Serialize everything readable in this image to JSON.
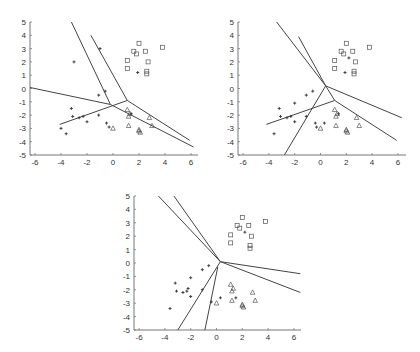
{
  "chart_data": [
    {
      "type": "scatter",
      "title": "",
      "xlabel": "",
      "ylabel": "",
      "xlim": [
        -6.5,
        6.5
      ],
      "ylim": [
        -5,
        5
      ],
      "xticks": [
        -6,
        -4,
        -2,
        0,
        2,
        4,
        6
      ],
      "yticks": [
        5,
        4,
        3,
        2,
        1,
        0,
        -1,
        -2,
        -3,
        -4,
        -5
      ],
      "grid": false,
      "frame": {
        "x0": 30,
        "x1": 198,
        "y0": 22,
        "y1": 155,
        "xpx_per_unit": 13.0,
        "x_zero": 113,
        "ypx_per_unit": 13.3,
        "y_zero": 88.5
      },
      "series": [
        {
          "name": "squares",
          "marker": "square",
          "points": [
            [
              2,
              3.4
            ],
            [
              3.8,
              3.1
            ],
            [
              1.6,
              2.8
            ],
            [
              1.8,
              2.6
            ],
            [
              2.5,
              2.8
            ],
            [
              2.7,
              2.0
            ],
            [
              1.1,
              2.1
            ],
            [
              1.1,
              1.5
            ],
            [
              2.6,
              1.3
            ],
            [
              2.6,
              1.1
            ]
          ]
        },
        {
          "name": "triangles",
          "marker": "triangle",
          "points": [
            [
              1.1,
              -1.6
            ],
            [
              1.3,
              -1.9
            ],
            [
              1.2,
              -2.1
            ],
            [
              2.8,
              -2.2
            ],
            [
              3.0,
              -2.8
            ],
            [
              1.2,
              -2.8
            ],
            [
              0.0,
              -3.0
            ],
            [
              2.0,
              -3.1
            ],
            [
              2.1,
              -3.3
            ],
            [
              2.0,
              -3.2
            ]
          ]
        },
        {
          "name": "plus",
          "marker": "plus",
          "points": [
            [
              -1,
              3
            ],
            [
              -3,
              2
            ],
            [
              -0.6,
              -0.2
            ],
            [
              -1.1,
              -0.5
            ],
            [
              -3.2,
              -1.5
            ],
            [
              -3.1,
              -2.1
            ],
            [
              -2.6,
              -2.2
            ],
            [
              -2.3,
              -2.1
            ],
            [
              -1.1,
              -2.0
            ],
            [
              -2.0,
              -2.5
            ],
            [
              -4.0,
              -3.0
            ],
            [
              -3.6,
              -3.4
            ],
            [
              -0.3,
              -2.9
            ],
            [
              -0.5,
              -2.6
            ],
            [
              1.9,
              1.2
            ],
            [
              1.4,
              -1.9
            ]
          ]
        }
      ],
      "lines": [
        [
          [
            -3.2,
            5
          ],
          [
            -0.2,
            -1.2
          ]
        ],
        [
          [
            -1.7,
            4
          ],
          [
            1.1,
            -0.9
          ]
        ],
        [
          [
            -6.5,
            0.1
          ],
          [
            -0.2,
            -1.2
          ]
        ],
        [
          [
            -0.2,
            -1.2
          ],
          [
            6.2,
            -4.4
          ]
        ],
        [
          [
            1.1,
            -0.9
          ],
          [
            5.9,
            -3.9
          ]
        ],
        [
          [
            -4.1,
            -2.7
          ],
          [
            1.1,
            -0.9
          ]
        ]
      ]
    },
    {
      "type": "scatter",
      "title": "",
      "xlabel": "",
      "ylabel": "",
      "xlim": [
        -6.5,
        6.5
      ],
      "ylim": [
        -5,
        5
      ],
      "xticks": [
        -6,
        -4,
        -2,
        0,
        2,
        4,
        6
      ],
      "yticks": [
        5,
        4,
        3,
        2,
        1,
        0,
        -1,
        -2,
        -3,
        -4,
        -5
      ],
      "grid": false,
      "frame": {
        "x0": 238,
        "x1": 406,
        "y0": 22,
        "y1": 155,
        "xpx_per_unit": 12.9,
        "x_zero": 320.5,
        "ypx_per_unit": 13.3,
        "y_zero": 88.5
      },
      "series": [
        {
          "name": "squares",
          "marker": "square",
          "points": [
            [
              2,
              3.4
            ],
            [
              3.8,
              3.1
            ],
            [
              1.6,
              2.8
            ],
            [
              1.8,
              2.6
            ],
            [
              2.5,
              2.8
            ],
            [
              2.7,
              2.0
            ],
            [
              1.1,
              2.1
            ],
            [
              1.1,
              1.5
            ],
            [
              2.6,
              1.3
            ],
            [
              2.6,
              1.1
            ]
          ]
        },
        {
          "name": "triangles",
          "marker": "triangle",
          "points": [
            [
              1.1,
              -1.6
            ],
            [
              1.3,
              -1.9
            ],
            [
              1.2,
              -2.1
            ],
            [
              2.8,
              -2.2
            ],
            [
              3.0,
              -2.8
            ],
            [
              1.2,
              -2.8
            ],
            [
              0.0,
              -3.0
            ],
            [
              2.0,
              -3.1
            ],
            [
              2.1,
              -3.3
            ],
            [
              2.0,
              -3.2
            ]
          ]
        },
        {
          "name": "plus",
          "marker": "plus",
          "points": [
            [
              2.2,
              2.3
            ],
            [
              1.9,
              1.2
            ],
            [
              -0.6,
              -0.2
            ],
            [
              -1.1,
              -0.5
            ],
            [
              -2,
              -1.1
            ],
            [
              -3.2,
              -1.5
            ],
            [
              -3.1,
              -2.1
            ],
            [
              -2.6,
              -2.2
            ],
            [
              -2.3,
              -2.1
            ],
            [
              -1.1,
              -2.1
            ],
            [
              -2.0,
              -2.5
            ],
            [
              -3.6,
              -3.4
            ],
            [
              -0.3,
              -2.9
            ],
            [
              -0.4,
              -2.6
            ],
            [
              0.3,
              -2.6
            ],
            [
              1.4,
              -1.9
            ]
          ]
        }
      ],
      "lines": [
        [
          [
            -3.4,
            5
          ],
          [
            0.4,
            0.2
          ]
        ],
        [
          [
            -1.7,
            3.9
          ],
          [
            0.4,
            0.2
          ]
        ],
        [
          [
            0.4,
            0.2
          ],
          [
            6.3,
            -2.2
          ]
        ],
        [
          [
            0.4,
            0.2
          ],
          [
            1.1,
            -0.9
          ]
        ],
        [
          [
            1.1,
            -0.9
          ],
          [
            5.9,
            -3.9
          ]
        ],
        [
          [
            -4.2,
            -2.7
          ],
          [
            1.1,
            -0.9
          ]
        ],
        [
          [
            0.4,
            0.2
          ],
          [
            -2.8,
            -5
          ]
        ]
      ]
    },
    {
      "type": "scatter",
      "title": "",
      "xlabel": "",
      "ylabel": "",
      "xlim": [
        -6.5,
        6.5
      ],
      "ylim": [
        -5,
        5
      ],
      "xticks": [
        -6,
        -4,
        -2,
        0,
        2,
        4,
        6
      ],
      "yticks": [
        5,
        4,
        3,
        2,
        1,
        0,
        -1,
        -2,
        -3,
        -4,
        -5
      ],
      "grid": false,
      "frame": {
        "x0": 134,
        "x1": 301,
        "y0": 196,
        "y1": 330,
        "xpx_per_unit": 12.9,
        "x_zero": 216.5,
        "ypx_per_unit": 13.4,
        "y_zero": 263
      },
      "series": [
        {
          "name": "squares",
          "marker": "square",
          "points": [
            [
              2,
              3.4
            ],
            [
              3.8,
              3.1
            ],
            [
              1.6,
              2.8
            ],
            [
              1.8,
              2.6
            ],
            [
              2.5,
              2.8
            ],
            [
              2.7,
              2.0
            ],
            [
              1.1,
              2.1
            ],
            [
              1.1,
              1.5
            ],
            [
              2.6,
              1.3
            ],
            [
              2.6,
              1.1
            ]
          ]
        },
        {
          "name": "triangles",
          "marker": "triangle",
          "points": [
            [
              1.1,
              -1.6
            ],
            [
              1.3,
              -1.9
            ],
            [
              1.2,
              -2.1
            ],
            [
              2.8,
              -2.2
            ],
            [
              3.0,
              -2.8
            ],
            [
              1.2,
              -2.8
            ],
            [
              0.0,
              -3.0
            ],
            [
              2.0,
              -3.1
            ],
            [
              2.1,
              -3.3
            ],
            [
              2.0,
              -3.2
            ]
          ]
        },
        {
          "name": "plus",
          "marker": "plus",
          "points": [
            [
              2.2,
              2.3
            ],
            [
              -0.6,
              -0.2
            ],
            [
              -1.1,
              -0.5
            ],
            [
              -2,
              -1.1
            ],
            [
              -3.2,
              -1.5
            ],
            [
              -3.1,
              -2.1
            ],
            [
              -2.6,
              -2.2
            ],
            [
              -2.3,
              -2.1
            ],
            [
              -2.2,
              -1.9
            ],
            [
              -1.1,
              -2.0
            ],
            [
              -2.0,
              -2.5
            ],
            [
              -3.6,
              -3.4
            ],
            [
              -0.4,
              -2.9
            ],
            [
              0.3,
              -2.6
            ],
            [
              1.5,
              -2.6
            ]
          ]
        }
      ],
      "lines": [
        [
          [
            -4.5,
            5
          ],
          [
            0.3,
            0.1
          ]
        ],
        [
          [
            -3.3,
            5
          ],
          [
            0.3,
            0.1
          ]
        ],
        [
          [
            0.3,
            0.1
          ],
          [
            6.5,
            -0.8
          ]
        ],
        [
          [
            0.3,
            0.1
          ],
          [
            6.5,
            -2.2
          ]
        ],
        [
          [
            0.3,
            0.1
          ],
          [
            -3.0,
            -5
          ]
        ],
        [
          [
            0.1,
            -0.3
          ],
          [
            -0.9,
            -5
          ]
        ]
      ]
    }
  ]
}
